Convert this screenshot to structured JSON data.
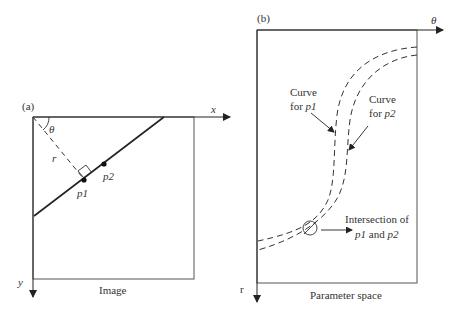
{
  "panel_a": {
    "label": "(a)",
    "x_axis": "x",
    "y_axis": "y",
    "angle": "θ",
    "distance": "r",
    "point1": "p1",
    "point2": "p2",
    "caption": "Image"
  },
  "panel_b": {
    "label": "(b)",
    "x_axis": "θ",
    "y_axis": "r",
    "curve1_line1": "Curve",
    "curve1_line2_prefix": "for ",
    "curve1_line2_var": "p1",
    "curve2_line1": "Curve",
    "curve2_line2_prefix": "for ",
    "curve2_line2_var": "p2",
    "intersection_line1": "Intersection of",
    "intersection_var1": "p1",
    "intersection_and": " and ",
    "intersection_var2": "p2",
    "caption": "Parameter space"
  },
  "colors": {
    "ink": "#333333",
    "background": "#ffffff"
  }
}
